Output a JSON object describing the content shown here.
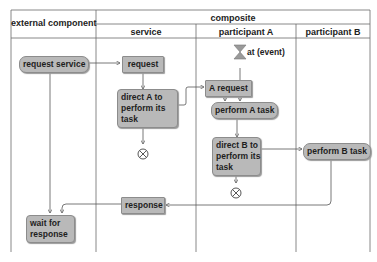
{
  "headers": {
    "external": "external component",
    "composite": "composite",
    "lanes": [
      "service",
      "participant A",
      "participant B"
    ]
  },
  "nodes": {
    "request_service": "request service",
    "request": "request",
    "direct_a": [
      "direct A to",
      "perform its",
      "task"
    ],
    "a_request": "A request",
    "perform_a": "perform A task",
    "direct_b": [
      "direct B to",
      "perform its",
      "task"
    ],
    "perform_b": "perform B task",
    "response": "response",
    "wait": [
      "wait for",
      "response"
    ]
  },
  "event_label": "at (event)",
  "colors": {
    "node_fill": "#b9b9b9",
    "line": "#555555"
  }
}
